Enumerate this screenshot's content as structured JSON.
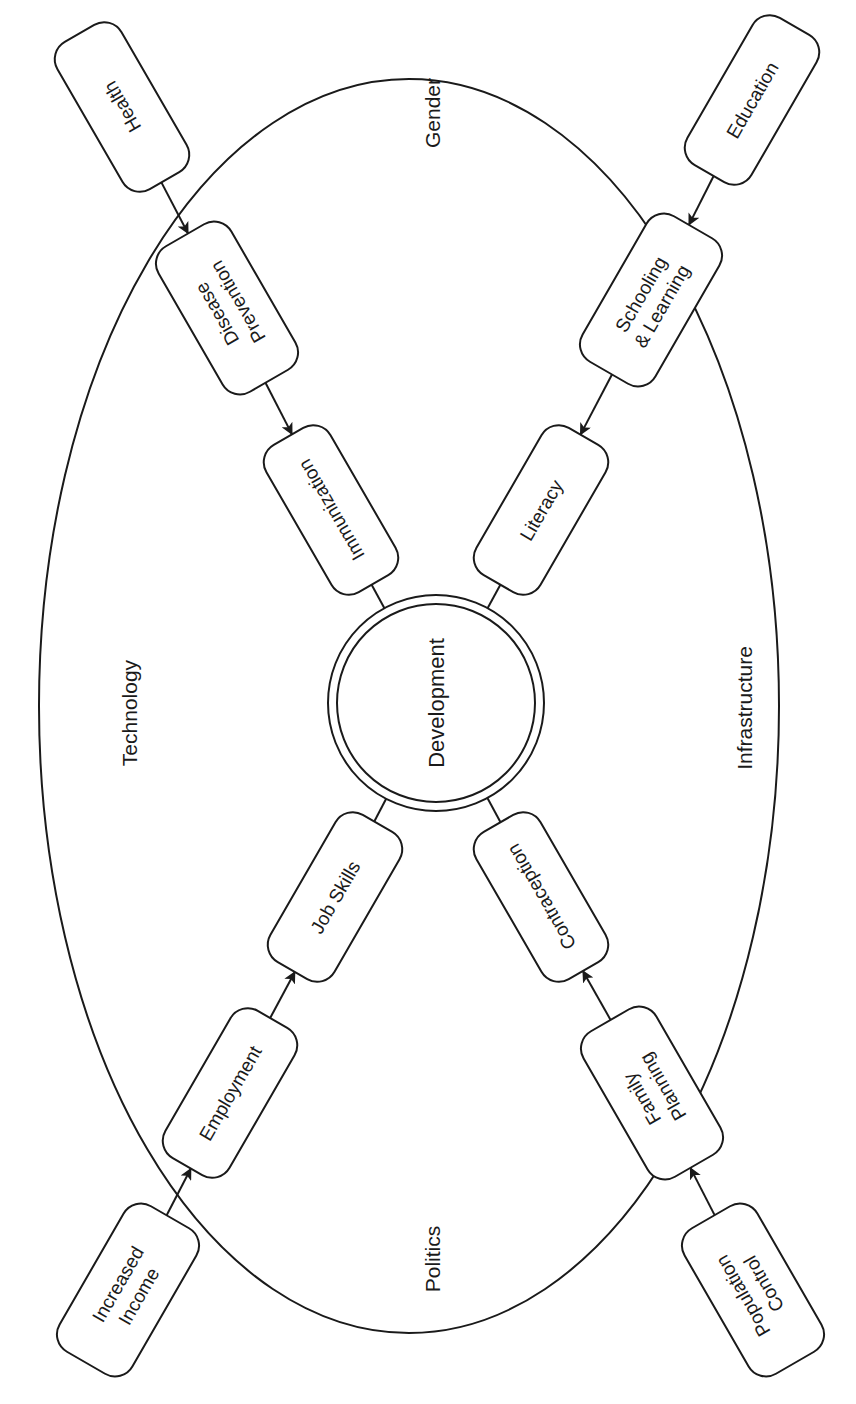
{
  "diagram": {
    "center": {
      "label": "Development"
    },
    "context_factors": [
      {
        "id": "gender",
        "label": "Gender"
      },
      {
        "id": "technology",
        "label": "Technology"
      },
      {
        "id": "infrastructure",
        "label": "Infrastructure"
      },
      {
        "id": "politics",
        "label": "Politics"
      }
    ],
    "chains": [
      {
        "id": "health-chain",
        "nodes": [
          {
            "id": "health",
            "lines": [
              "Health"
            ]
          },
          {
            "id": "disease-prevention",
            "lines": [
              "Disease",
              "Prevention"
            ]
          },
          {
            "id": "immunization",
            "lines": [
              "Immunization"
            ]
          }
        ]
      },
      {
        "id": "education-chain",
        "nodes": [
          {
            "id": "education",
            "lines": [
              "Education"
            ]
          },
          {
            "id": "schooling-learning",
            "lines": [
              "Schooling",
              "& Learning"
            ]
          },
          {
            "id": "literacy",
            "lines": [
              "Literacy"
            ]
          }
        ]
      },
      {
        "id": "income-chain",
        "nodes": [
          {
            "id": "increased-income",
            "lines": [
              "Increased",
              "Income"
            ]
          },
          {
            "id": "employment",
            "lines": [
              "Employment"
            ]
          },
          {
            "id": "job-skills",
            "lines": [
              "Job Skills"
            ]
          }
        ]
      },
      {
        "id": "population-chain",
        "nodes": [
          {
            "id": "population-control",
            "lines": [
              "Population",
              "Control"
            ]
          },
          {
            "id": "family-planning",
            "lines": [
              "Family",
              "Planning"
            ]
          },
          {
            "id": "contraception",
            "lines": [
              "Contraception"
            ]
          }
        ]
      }
    ],
    "edges": [
      {
        "from": "health",
        "to": "disease-prevention"
      },
      {
        "from": "disease-prevention",
        "to": "immunization"
      },
      {
        "from": "immunization",
        "to": "development"
      },
      {
        "from": "education",
        "to": "schooling-learning"
      },
      {
        "from": "schooling-learning",
        "to": "literacy"
      },
      {
        "from": "literacy",
        "to": "development"
      },
      {
        "from": "increased-income",
        "to": "employment"
      },
      {
        "from": "employment",
        "to": "job-skills"
      },
      {
        "from": "job-skills",
        "to": "development"
      },
      {
        "from": "population-control",
        "to": "family-planning"
      },
      {
        "from": "family-planning",
        "to": "contraception"
      },
      {
        "from": "contraception",
        "to": "development"
      }
    ],
    "colors": {
      "stroke": "#1a1a1a",
      "background": "#ffffff"
    }
  }
}
